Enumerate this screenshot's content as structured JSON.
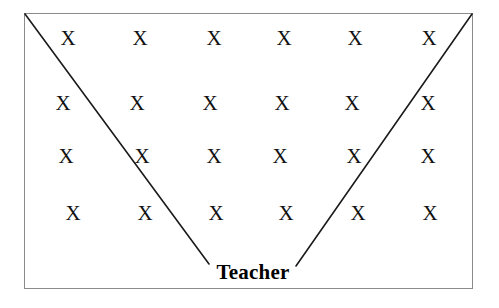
{
  "diagram": {
    "background_color": "#ffffff",
    "room": {
      "border_color": "#8b8b8b",
      "fill_color": "#ffffff",
      "x": 24,
      "y": 13,
      "width": 449,
      "height": 276
    },
    "teacher": {
      "label": "Teacher",
      "x": 253,
      "y": 272,
      "color": "#000000"
    },
    "sight_lines": {
      "color": "#1a1a1a",
      "width": 1.6,
      "lines": [
        {
          "name": "left-sight-line",
          "x1": 25,
          "y1": 14,
          "x2": 209,
          "y2": 264
        },
        {
          "name": "right-sight-line",
          "x1": 472,
          "y1": 14,
          "x2": 296,
          "y2": 266
        }
      ]
    },
    "student_mark": "X",
    "rows": [
      {
        "name": "row-1",
        "y": 38,
        "seats": [
          {
            "label": "X",
            "x": 68
          },
          {
            "label": "X",
            "x": 140
          },
          {
            "label": "X",
            "x": 214
          },
          {
            "label": "X",
            "x": 284
          },
          {
            "label": "X",
            "x": 355
          },
          {
            "label": "X",
            "x": 429
          }
        ]
      },
      {
        "name": "row-2",
        "y": 103,
        "seats": [
          {
            "label": "X",
            "x": 63
          },
          {
            "label": "X",
            "x": 137
          },
          {
            "label": "X",
            "x": 210
          },
          {
            "label": "X",
            "x": 282
          },
          {
            "label": "X",
            "x": 352
          },
          {
            "label": "X",
            "x": 428
          }
        ]
      },
      {
        "name": "row-3",
        "y": 156,
        "seats": [
          {
            "label": "X",
            "x": 66
          },
          {
            "label": "X",
            "x": 142
          },
          {
            "label": "X",
            "x": 214
          },
          {
            "label": "X",
            "x": 280
          },
          {
            "label": "X",
            "x": 354
          },
          {
            "label": "X",
            "x": 428
          }
        ]
      },
      {
        "name": "row-4",
        "y": 213,
        "seats": [
          {
            "label": "X",
            "x": 73
          },
          {
            "label": "X",
            "x": 145
          },
          {
            "label": "X",
            "x": 216
          },
          {
            "label": "X",
            "x": 286
          },
          {
            "label": "X",
            "x": 358
          },
          {
            "label": "X",
            "x": 430
          }
        ]
      }
    ]
  }
}
